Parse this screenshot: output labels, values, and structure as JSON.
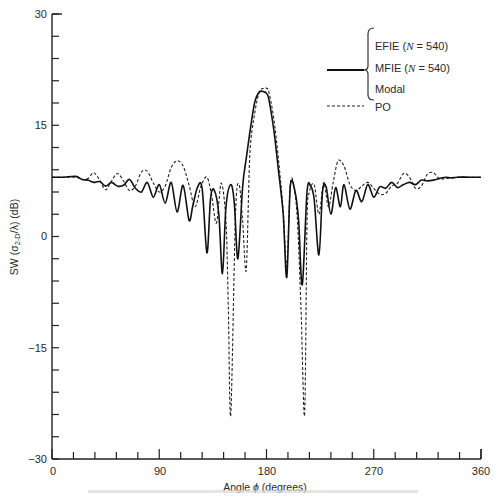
{
  "chart_data": {
    "type": "line",
    "title": "",
    "xlabel": "Angle ϕ (degrees)",
    "ylabel": "SW (σ₂-D/λ) (dB)",
    "xlim": [
      0,
      360
    ],
    "ylim": [
      -30,
      30
    ],
    "xticks": [
      0,
      90,
      180,
      270,
      360
    ],
    "yticks": [
      -30,
      -15,
      0,
      15,
      30
    ],
    "grid": false,
    "legend_position": "upper right",
    "legend": {
      "solid_group": [
        "EFIE (N = 540)",
        "MFIE (N = 540)",
        "Modal"
      ],
      "dashed": "PO"
    },
    "series": [
      {
        "name": "EFIE / MFIE / Modal",
        "style": "solid",
        "x": [
          0,
          10,
          20,
          25,
          30,
          35,
          40,
          45,
          50,
          55,
          60,
          65,
          70,
          75,
          80,
          85,
          90,
          95,
          100,
          105,
          110,
          115,
          118,
          122,
          126,
          130,
          133,
          136,
          140,
          143,
          146,
          150,
          153,
          156,
          160,
          163,
          166,
          170,
          174,
          178,
          180,
          182,
          186,
          190,
          194,
          197,
          200,
          204,
          207,
          210,
          214,
          217,
          220,
          224,
          227,
          230,
          234,
          238,
          242,
          245,
          250,
          255,
          260,
          265,
          270,
          275,
          280,
          285,
          290,
          295,
          300,
          305,
          310,
          315,
          320,
          325,
          330,
          335,
          340,
          350,
          360
        ],
        "y": [
          8,
          8,
          8.1,
          7.7,
          7.6,
          7.3,
          7.4,
          6.8,
          7.3,
          6.8,
          6.9,
          7.7,
          6.5,
          6.0,
          7.3,
          5.3,
          7.0,
          4.5,
          7.3,
          3.3,
          6.9,
          2.2,
          4.0,
          6.6,
          6.5,
          -2.2,
          5.0,
          6.3,
          3.0,
          -5.0,
          4.0,
          7.0,
          4.5,
          -3.0,
          6.8,
          10.5,
          14.0,
          18.0,
          19.5,
          19.5,
          19.3,
          18.5,
          14.5,
          9.0,
          3.0,
          -5.5,
          6.8,
          6.0,
          2.0,
          -6.5,
          6.0,
          6.8,
          5.0,
          -2.5,
          6.0,
          6.7,
          3.0,
          6.6,
          4.0,
          7.0,
          3.7,
          6.2,
          4.7,
          7.0,
          5.3,
          6.7,
          6.5,
          7.3,
          6.6,
          7.0,
          7.3,
          7.0,
          7.6,
          7.5,
          7.6,
          7.8,
          8.0,
          7.9,
          8.0,
          8.0,
          8.0
        ]
      },
      {
        "name": "PO",
        "style": "dashed",
        "x": [
          0,
          10,
          20,
          25,
          30,
          35,
          40,
          45,
          50,
          55,
          60,
          65,
          70,
          75,
          80,
          85,
          90,
          95,
          100,
          105,
          110,
          115,
          120,
          125,
          130,
          134,
          138,
          142,
          146,
          148,
          150,
          154,
          157,
          160,
          163,
          166,
          170,
          174,
          178,
          180,
          182,
          186,
          190,
          194,
          197,
          200,
          203,
          206,
          209,
          212,
          214,
          216,
          220,
          224,
          228,
          232,
          236,
          240,
          245,
          250,
          255,
          260,
          265,
          270,
          275,
          280,
          285,
          290,
          295,
          300,
          305,
          310,
          315,
          320,
          325,
          330,
          340,
          350,
          360
        ],
        "y": [
          8,
          8,
          8.0,
          7.7,
          7.8,
          8.6,
          7.6,
          6.3,
          7.5,
          8.5,
          7.5,
          6.2,
          6.8,
          8.7,
          8.8,
          7.2,
          6.0,
          6.8,
          9.3,
          10.2,
          9.5,
          7.0,
          4.0,
          6.8,
          8.0,
          5.5,
          1.8,
          7.2,
          2.0,
          -10.0,
          -24.0,
          3.0,
          7.0,
          2.0,
          -4.5,
          11.0,
          16.5,
          19.5,
          20.0,
          20.0,
          19.5,
          16.0,
          10.5,
          3.5,
          -4.0,
          7.0,
          6.8,
          2.0,
          -10.0,
          -24.0,
          2.0,
          6.0,
          7.0,
          3.0,
          7.3,
          4.0,
          7.3,
          10.2,
          9.5,
          7.0,
          6.2,
          6.8,
          7.3,
          6.5,
          5.7,
          5.8,
          6.8,
          7.2,
          8.5,
          8.0,
          6.5,
          6.8,
          8.4,
          8.6,
          7.8,
          7.8,
          8.0,
          8.0,
          8.0
        ]
      }
    ]
  },
  "axes": {
    "x_tick_labels": [
      "0",
      "90",
      "180",
      "270",
      "360"
    ],
    "y_tick_labels": [
      "30",
      "15",
      "0",
      "−15",
      "−30"
    ]
  },
  "labels": {
    "xlabel_prefix": "Angle ",
    "xlabel_symbol": "ϕ",
    "xlabel_suffix": " (degrees)",
    "ylabel_prefix": "SW (σ",
    "ylabel_sub": "2-D",
    "ylabel_suffix": "/λ) (dB)"
  },
  "legend": {
    "efie": "EFIE (",
    "mfie": "MFIE (",
    "n_symbol": "N",
    "n_value": " = 540)",
    "modal": "Modal",
    "po": "PO"
  }
}
